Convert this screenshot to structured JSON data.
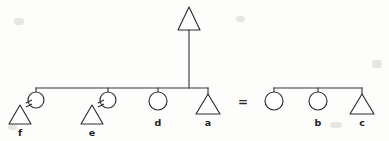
{
  "diagram": {
    "notation": {
      "triangle_meaning": "male",
      "circle_meaning": "female",
      "equals_meaning": "marriage / equivalence",
      "horizontal_line_meaning": "sibling set",
      "vertical_line_meaning": "descent"
    },
    "colors": {
      "ink": "#2e2e33",
      "line": "#3a3a3f",
      "paper": "#fdfdfc",
      "shape_fill": "#ffffff"
    },
    "equation_operator": "=",
    "left_group": {
      "name": "left-kin-group",
      "descendant": {
        "label": "",
        "shape": "triangle",
        "x": 189,
        "y": 22
      },
      "sibling_line": {
        "x1": 36,
        "x2": 208,
        "y": 88
      },
      "descent_line": {
        "x": 189,
        "y1": 33,
        "y2": 88
      },
      "members": [
        {
          "label": "f",
          "shape": "triangle",
          "spouse_shape": "circle",
          "spouse_label": "",
          "marriage": true,
          "x": 44,
          "y": 98
        },
        {
          "label": "e",
          "shape": "triangle",
          "spouse_shape": "circle",
          "spouse_label": "",
          "marriage": true,
          "x": 116,
          "y": 98
        },
        {
          "label": "d",
          "shape": "circle",
          "marriage": false,
          "x": 166,
          "y": 98
        },
        {
          "label": "a",
          "shape": "triangle",
          "marriage": false,
          "x": 208,
          "y": 98
        }
      ]
    },
    "right_group": {
      "name": "right-kin-group",
      "sibling_line": {
        "x1": 274,
        "x2": 362,
        "y": 88
      },
      "members": [
        {
          "label": "",
          "shape": "circle",
          "x": 274,
          "y": 98
        },
        {
          "label": "b",
          "shape": "circle",
          "x": 318,
          "y": 98
        },
        {
          "label": "c",
          "shape": "triangle",
          "x": 362,
          "y": 98
        }
      ]
    },
    "labels": [
      {
        "text": "f",
        "x": 44,
        "y": 136
      },
      {
        "text": "e",
        "x": 116,
        "y": 136
      },
      {
        "text": "d",
        "x": 166,
        "y": 126
      },
      {
        "text": "a",
        "x": 208,
        "y": 126
      },
      {
        "text": "b",
        "x": 318,
        "y": 126
      },
      {
        "text": "c",
        "x": 362,
        "y": 126
      }
    ]
  }
}
